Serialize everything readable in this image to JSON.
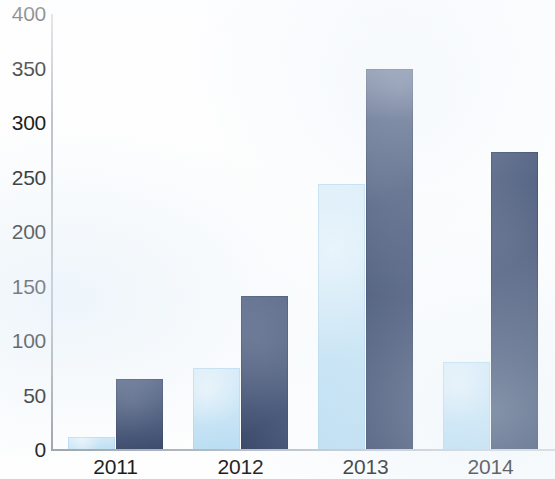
{
  "chart_data": {
    "type": "bar",
    "title": "",
    "subtitle": "",
    "xlabel": "",
    "ylabel": "",
    "categories": [
      "2011",
      "2012",
      "2013",
      "2014"
    ],
    "series": [
      {
        "name": "Light blue series",
        "color": "#c0e1f4",
        "values": [
          12,
          75,
          244,
          81
        ]
      },
      {
        "name": "Dark blue series",
        "color": "#3c4c71",
        "values": [
          65,
          141,
          350,
          273
        ]
      }
    ],
    "ylim": [
      0,
      400
    ],
    "y_ticks": [
      "0",
      "50",
      "100",
      "150",
      "200",
      "250",
      "300",
      "350",
      "400"
    ],
    "y_tick_values": [
      0,
      50,
      100,
      150,
      200,
      250,
      300,
      350,
      400
    ],
    "grid": false,
    "legend": "none",
    "legend_position": "none",
    "annotations": [],
    "axis_color": "#b4b9c0",
    "text_color": "#1c1c1c",
    "background_color": "#ffffff"
  },
  "accessibility": {
    "summary": "Grouped bar chart with four year categories, each showing a light blue bar and a dark blue bar."
  }
}
